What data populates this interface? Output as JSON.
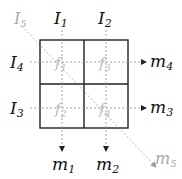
{
  "diagram": {
    "inputs": {
      "I1": {
        "name": "I",
        "sub": "1"
      },
      "I2": {
        "name": "I",
        "sub": "2"
      },
      "I3": {
        "name": "I",
        "sub": "3"
      },
      "I4": {
        "name": "I",
        "sub": "4"
      },
      "I5": {
        "name": "I",
        "sub": "5"
      }
    },
    "outputs": {
      "m1": {
        "name": "m",
        "sub": "1"
      },
      "m2": {
        "name": "m",
        "sub": "2"
      },
      "m3": {
        "name": "m",
        "sub": "3"
      },
      "m4": {
        "name": "m",
        "sub": "4"
      },
      "m5": {
        "name": "m",
        "sub": "5"
      }
    },
    "cells": {
      "top_left": {
        "name": "f",
        "sub": "1"
      },
      "bottom_left": {
        "name": "f",
        "sub": "2"
      },
      "top_right": {
        "name": "f",
        "sub": "3"
      },
      "bottom_right": {
        "name": "f",
        "sub": "4"
      }
    },
    "colors": {
      "grid": "#222222",
      "text": "#111111",
      "faded_text": "#aaaaaa",
      "dashed_line": "#999999",
      "diagonal_line": "#cccccc",
      "cell_label": "#bbbbbb"
    }
  }
}
